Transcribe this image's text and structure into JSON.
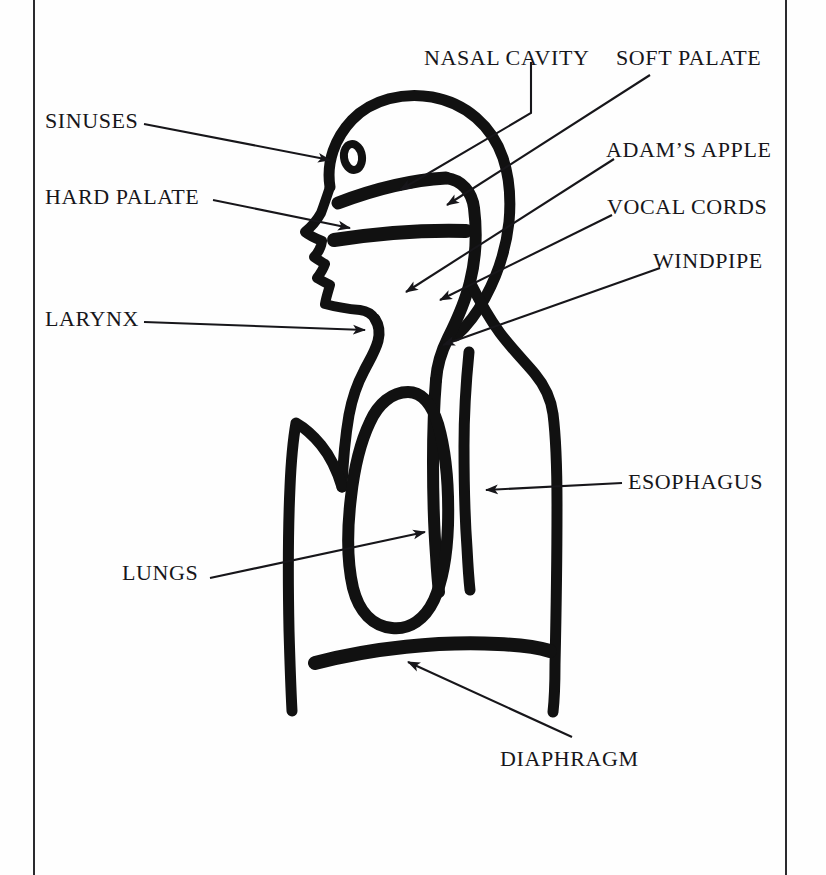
{
  "figure": {
    "background_color": "#fefefe",
    "ink_color": "#111111",
    "border_color": "#2a2a2e"
  },
  "labels": [
    {
      "id": "sinuses",
      "text": "SINUSES",
      "x": 45,
      "y": 110,
      "align": "left"
    },
    {
      "id": "hard_palate",
      "text": "HARD PALATE",
      "x": 45,
      "y": 186,
      "align": "left"
    },
    {
      "id": "larynx",
      "text": "LARYNX",
      "x": 45,
      "y": 308,
      "align": "left"
    },
    {
      "id": "lungs",
      "text": "LUNGS",
      "x": 122,
      "y": 562,
      "align": "left"
    },
    {
      "id": "nasal_cavity",
      "text": "NASAL CAVITY",
      "x": 424,
      "y": 47,
      "align": "left"
    },
    {
      "id": "soft_palate",
      "text": "SOFT PALATE",
      "x": 616,
      "y": 47,
      "align": "left"
    },
    {
      "id": "adams_apple",
      "text": "ADAM’S APPLE",
      "x": 606,
      "y": 139,
      "align": "left"
    },
    {
      "id": "vocal_cords",
      "text": "VOCAL CORDS",
      "x": 607,
      "y": 196,
      "align": "left"
    },
    {
      "id": "windpipe",
      "text": "WINDPIPE",
      "x": 653,
      "y": 250,
      "align": "left"
    },
    {
      "id": "esophagus",
      "text": "ESOPHAGUS",
      "x": 628,
      "y": 471,
      "align": "left"
    },
    {
      "id": "diaphragm",
      "text": "DIAPHRAGM",
      "x": 500,
      "y": 748,
      "align": "left"
    }
  ],
  "anatomy_parts": [
    "skull-outline",
    "eye",
    "nasal-cavity-band",
    "hard-palate-band",
    "soft-palate-curve",
    "pharynx-curve",
    "jaw-chin-profile",
    "larynx-notch",
    "trachea-tube",
    "torso-outline",
    "lung-loop",
    "diaphragm-band",
    "esophagus-line"
  ],
  "leaders": [
    {
      "id": "sinuses-leader",
      "from": "SINUSES",
      "to": "sinus region of skull"
    },
    {
      "id": "hard-palate-leader",
      "from": "HARD PALATE",
      "to": "hard palate band"
    },
    {
      "id": "larynx-leader",
      "from": "LARYNX",
      "to": "larynx notch at throat"
    },
    {
      "id": "lungs-leader",
      "from": "LUNGS",
      "to": "lung interior"
    },
    {
      "id": "nasal-cavity-leader",
      "from": "NASAL CAVITY",
      "to": "nasal passage"
    },
    {
      "id": "soft-palate-leader",
      "from": "SOFT PALATE",
      "to": "soft palate"
    },
    {
      "id": "adams-apple-leader",
      "from": "ADAM’S APPLE",
      "to": "adam's apple prominence"
    },
    {
      "id": "vocal-cords-leader",
      "from": "VOCAL CORDS",
      "to": "vocal cord area"
    },
    {
      "id": "windpipe-leader",
      "from": "WINDPIPE",
      "to": "trachea tube"
    },
    {
      "id": "esophagus-leader",
      "from": "ESOPHAGUS",
      "to": "esophagus line"
    },
    {
      "id": "diaphragm-leader",
      "from": "DIAPHRAGM",
      "to": "diaphragm band"
    }
  ]
}
